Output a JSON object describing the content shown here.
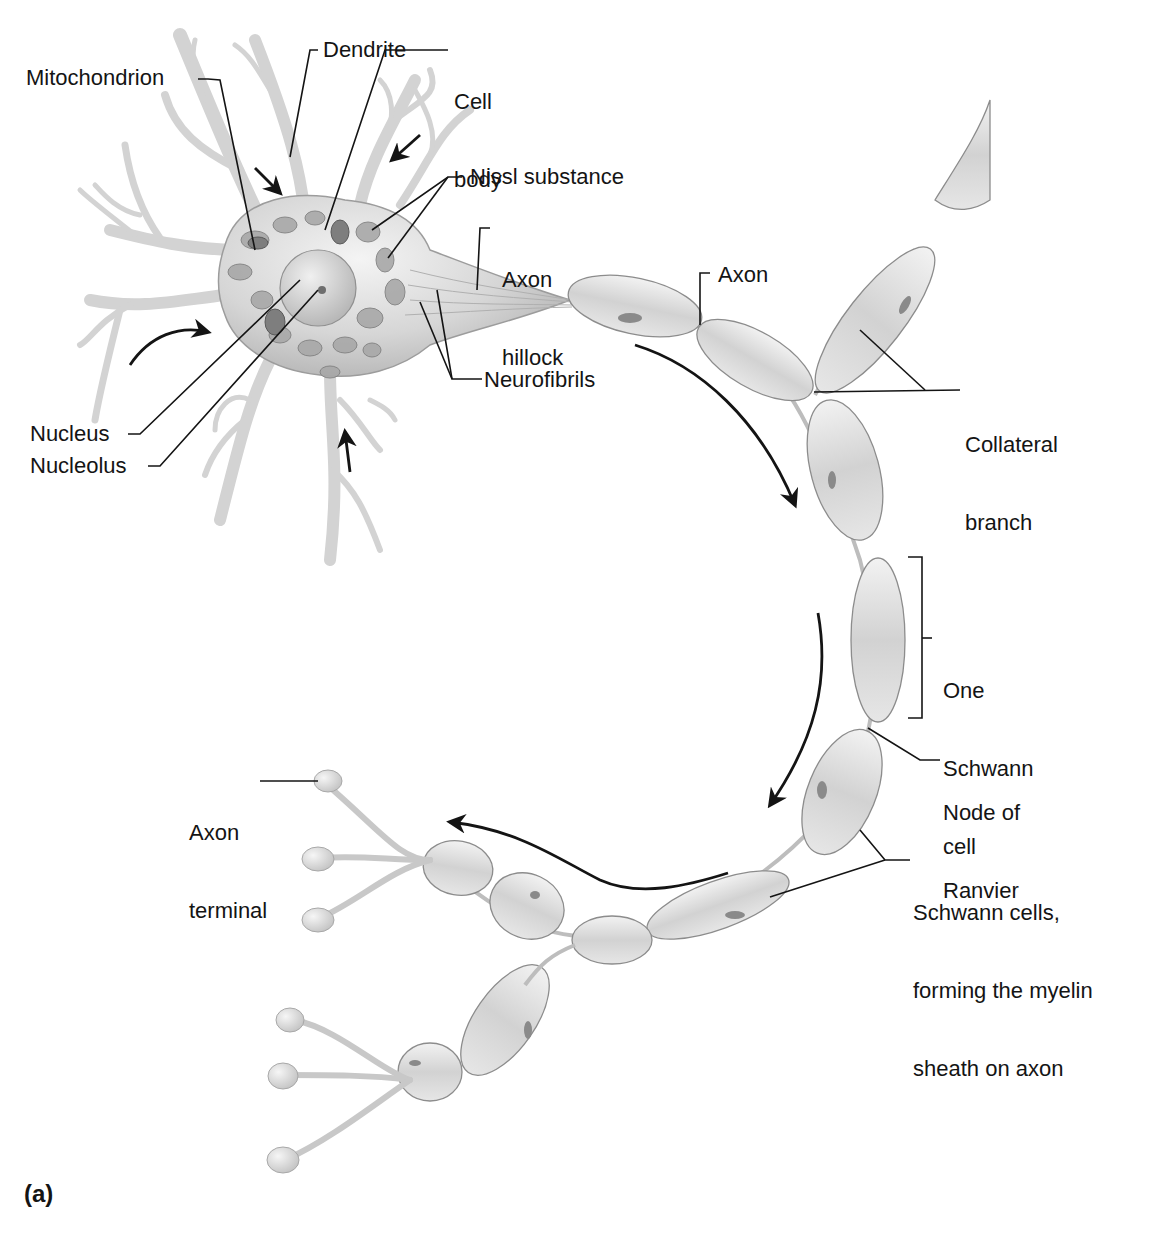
{
  "figure": {
    "panel_label": "(a)",
    "colors": {
      "background": "#ffffff",
      "cell": "#d9d9d9",
      "cell_shadow": "#9a9a9a",
      "outline": "#8a8a8a",
      "leader_line": "#141414",
      "text": "#141414"
    }
  },
  "labels": {
    "mitochondrion": "Mitochondrion",
    "dendrite": "Dendrite",
    "cell_body_line1": "Cell",
    "cell_body_line2": "body",
    "nissl_substance": "Nissl substance",
    "axon_hillock_line1": "Axon",
    "axon_hillock_line2": "hillock",
    "axon": "Axon",
    "neurofibrils": "Neurofibrils",
    "collateral_branch_line1": "Collateral",
    "collateral_branch_line2": "branch",
    "nucleus": "Nucleus",
    "nucleolus": "Nucleolus",
    "one_schwann_cell_line1": "One",
    "one_schwann_cell_line2": "Schwann",
    "one_schwann_cell_line3": "cell",
    "node_of_ranvier_line1": "Node of",
    "node_of_ranvier_line2": "Ranvier",
    "axon_terminal_line1": "Axon",
    "axon_terminal_line2": "terminal",
    "schwann_cells_line1": "Schwann cells,",
    "schwann_cells_line2": "forming the myelin",
    "schwann_cells_line3": "sheath on axon"
  }
}
